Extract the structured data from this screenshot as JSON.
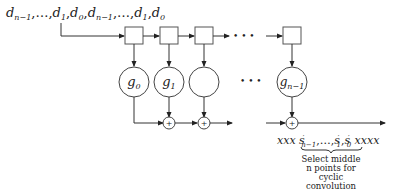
{
  "diagram": {
    "input_sequence": {
      "parts": [
        {
          "base": "d",
          "sub": "n−1"
        },
        {
          "text": ",…,"
        },
        {
          "base": "d",
          "sub": "1"
        },
        {
          "text": ","
        },
        {
          "base": "d",
          "sub": "0"
        },
        {
          "text": ","
        },
        {
          "base": "d",
          "sub": "n−1"
        },
        {
          "text": ",…,"
        },
        {
          "base": "d",
          "sub": "1"
        },
        {
          "text": ","
        },
        {
          "base": "d",
          "sub": "0"
        }
      ]
    },
    "delay_elements_count_visible": 4,
    "ellipsis": "• • •",
    "coefficients": [
      {
        "base": "g",
        "sub": "0"
      },
      {
        "base": "g",
        "sub": "1"
      },
      {
        "base": "",
        "sub": ""
      },
      {
        "base": "g",
        "sub": "n−1"
      }
    ],
    "adder_symbol": "+",
    "output": {
      "prefix": "xxx",
      "suffix": "xxxx",
      "terms": [
        {
          "base": "s",
          "prime": "′",
          "sub": "n−1"
        },
        {
          "text": ",…,"
        },
        {
          "base": "s",
          "prime": "′",
          "sub": "1"
        },
        {
          "text": ","
        },
        {
          "base": "s",
          "prime": "′",
          "sub": "0"
        }
      ]
    },
    "caption_lines": [
      "Select middle",
      "n points for",
      "cyclic",
      "convolution"
    ]
  }
}
